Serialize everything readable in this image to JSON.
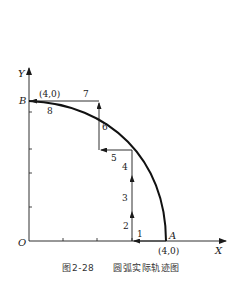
{
  "diagram": {
    "axes": {
      "x_label": "X",
      "y_label": "Y",
      "origin_label": "O"
    },
    "points": {
      "A": {
        "label": "A",
        "coord_label": "(4,0)"
      },
      "B": {
        "label": "B",
        "coord_label": "(4,0)"
      }
    },
    "steps": [
      {
        "n": "1",
        "direction": "left"
      },
      {
        "n": "2",
        "direction": "up"
      },
      {
        "n": "3",
        "direction": "up"
      },
      {
        "n": "4",
        "direction": "up"
      },
      {
        "n": "5",
        "direction": "left"
      },
      {
        "n": "6",
        "direction": "up"
      },
      {
        "n": "7",
        "direction": "left"
      },
      {
        "n": "8",
        "direction": "arc"
      }
    ],
    "colors": {
      "line": "#1a1a1a",
      "arc": "#111111"
    }
  },
  "caption": {
    "figure_number": "图2-28",
    "title": "圆弧实际轨迹图"
  }
}
